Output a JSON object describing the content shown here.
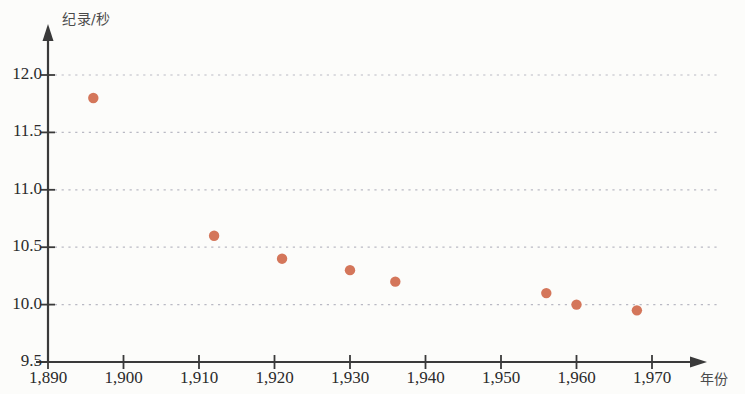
{
  "chart_data": {
    "type": "scatter",
    "title": "",
    "xlabel": "年份",
    "ylabel": "纪录/秒",
    "xlim": [
      1890,
      1977
    ],
    "ylim": [
      9.5,
      12.0
    ],
    "grid": true,
    "legend": null,
    "point_color": "#d4765a",
    "axis_color": "#3a3a3a",
    "grid_color": "#b9b9c4",
    "background": "#fcfcfa",
    "x_ticks": [
      {
        "value": 1890,
        "label": "1,890"
      },
      {
        "value": 1900,
        "label": "1,900"
      },
      {
        "value": 1910,
        "label": "1,910"
      },
      {
        "value": 1920,
        "label": "1,920"
      },
      {
        "value": 1930,
        "label": "1,930"
      },
      {
        "value": 1940,
        "label": "1,940"
      },
      {
        "value": 1950,
        "label": "1,950"
      },
      {
        "value": 1960,
        "label": "1,960"
      },
      {
        "value": 1970,
        "label": "1,970"
      }
    ],
    "y_ticks": [
      {
        "value": 12.0,
        "label": "12.0"
      },
      {
        "value": 11.5,
        "label": "11.5"
      },
      {
        "value": 11.0,
        "label": "11.0"
      },
      {
        "value": 10.5,
        "label": "10.5"
      },
      {
        "value": 10.0,
        "label": "10.0"
      },
      {
        "value": 9.5,
        "label": "9.5"
      }
    ],
    "points": [
      {
        "x": 1896,
        "y": 11.8
      },
      {
        "x": 1912,
        "y": 10.6
      },
      {
        "x": 1921,
        "y": 10.4
      },
      {
        "x": 1930,
        "y": 10.3
      },
      {
        "x": 1936,
        "y": 10.2
      },
      {
        "x": 1956,
        "y": 10.1
      },
      {
        "x": 1960,
        "y": 10.0
      },
      {
        "x": 1968,
        "y": 9.95
      }
    ]
  }
}
